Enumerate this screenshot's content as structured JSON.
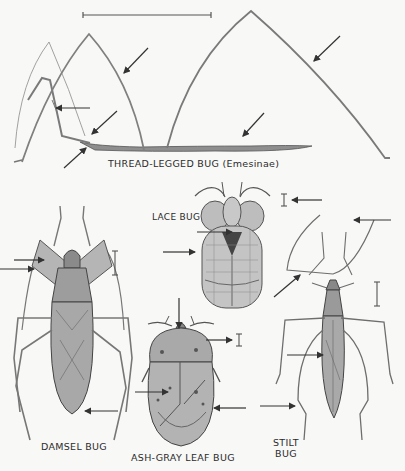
{
  "plate": {
    "background": "#f8f8f6",
    "ink": "#3a3a3a",
    "specimens": [
      {
        "id": "thread-legged",
        "label": "THREAD-LEGGED BUG (Emesinae)"
      },
      {
        "id": "lace",
        "label": "LACE BUG"
      },
      {
        "id": "damsel",
        "label": "DAMSEL BUG"
      },
      {
        "id": "ash-gray-leaf",
        "label": "ASH-GRAY LEAF BUG"
      },
      {
        "id": "stilt",
        "label_line1": "STILT",
        "label_line2": "BUG"
      }
    ]
  }
}
